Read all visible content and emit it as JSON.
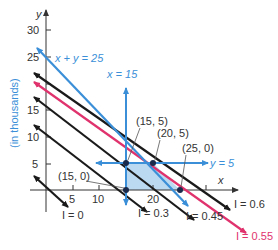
{
  "figure": {
    "title": "",
    "y_axis_label": "(in thousands)",
    "x_axis_var": "x",
    "y_axis_var": "y",
    "y_ticks": [
      "5",
      "10",
      "15",
      "25",
      "30"
    ],
    "x_ticks": [
      "5",
      "10",
      "20"
    ],
    "colors": {
      "blue": "#3a8fd8",
      "pink": "#e0336e",
      "black": "#1a1a1a",
      "region": "#bcd9f2",
      "axis": "#333333"
    },
    "constraints": [
      {
        "label": "x + y = 25",
        "color": "blue"
      },
      {
        "label": "x = 15",
        "color": "blue"
      },
      {
        "label": "y = 5",
        "color": "blue"
      }
    ],
    "iso_lines": [
      {
        "label": "I = 0"
      },
      {
        "label": "I = 0.3"
      },
      {
        "label": "I = 0.45"
      },
      {
        "label": "I = 0.55"
      },
      {
        "label": "I = 0.6"
      }
    ],
    "points": [
      {
        "label": "(15, 0)"
      },
      {
        "label": "(15, 5)"
      },
      {
        "label": "(20, 5)"
      },
      {
        "label": "(25, 0)"
      }
    ]
  }
}
